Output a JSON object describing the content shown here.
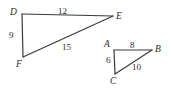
{
  "figure": {
    "background_color": "#ffffff",
    "stroke_color": "#3a3a3a",
    "label_color": "#2b2b2b",
    "triangles": [
      {
        "name": "triangle-DEF",
        "vertices": [
          {
            "label": "D",
            "x": 22,
            "y": 14
          },
          {
            "label": "E",
            "x": 113,
            "y": 16
          },
          {
            "label": "F",
            "x": 23,
            "y": 57
          }
        ],
        "sides": [
          {
            "name": "DE",
            "label": "12"
          },
          {
            "name": "DF",
            "label": "9"
          },
          {
            "name": "FE",
            "label": "15"
          }
        ]
      },
      {
        "name": "triangle-ABC",
        "vertices": [
          {
            "label": "A",
            "x": 114,
            "y": 50
          },
          {
            "label": "B",
            "x": 152,
            "y": 50
          },
          {
            "label": "C",
            "x": 115,
            "y": 74
          }
        ],
        "sides": [
          {
            "name": "AB",
            "label": "8"
          },
          {
            "name": "AC",
            "label": "6"
          },
          {
            "name": "CB",
            "label": "10"
          }
        ]
      }
    ]
  }
}
